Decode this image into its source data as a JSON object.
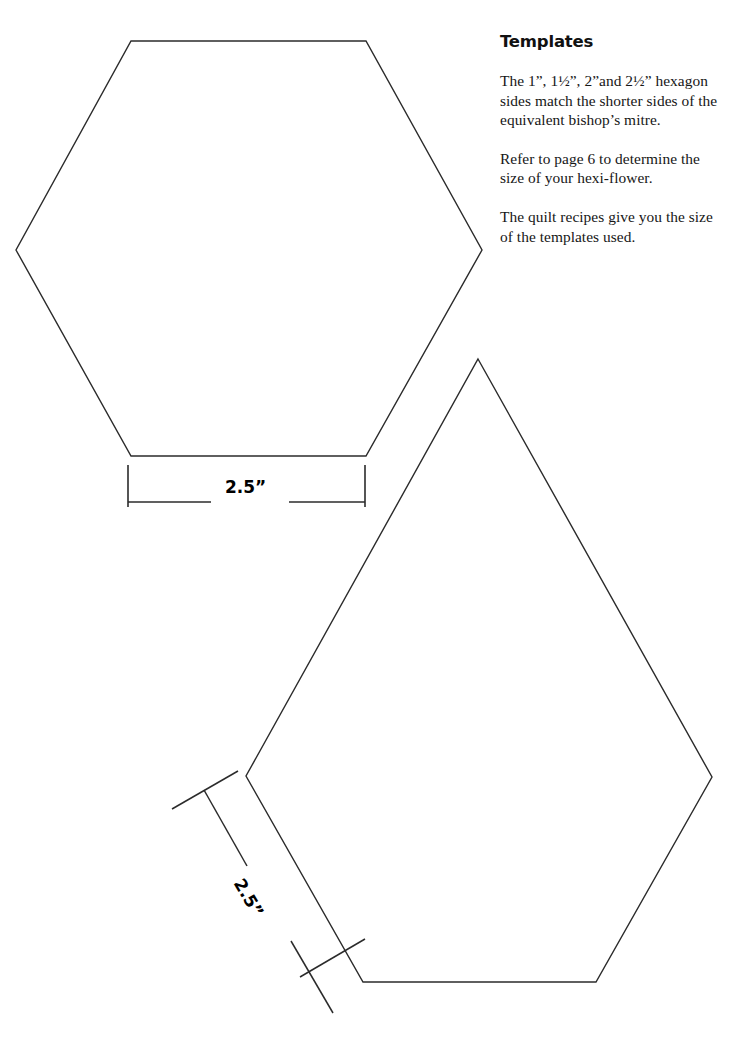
{
  "page": {
    "width": 749,
    "height": 1050,
    "background_color": "#ffffff",
    "ink_color": "#2b2b2b"
  },
  "sidebar": {
    "heading": "Templates",
    "paragraphs": [
      "The 1”, 1½”, 2”and 2½” hexagon sides match the shorter sides of the equivalent bishop’s mitre.",
      "Refer to page 6 to determine the size of your hexi-flower.",
      "The quilt recipes give you the size of the templates used."
    ]
  },
  "templates": [
    {
      "name": "hexagon-template",
      "shape": "hexagon",
      "dimension_label": "2.5”",
      "points": "131,41 366,41 482,250 366,456 131,456 16,250",
      "dimension": {
        "line": "128,503 208,503",
        "line2": "288,503 365,503",
        "tick_left": "128,465 128,507",
        "tick_right": "365,465 365,507"
      }
    },
    {
      "name": "bishops-mitre-template",
      "shape": "pentagon",
      "dimension_label": "2.5”",
      "points": "478,359 712,777 596,982 363,982 246,776",
      "dimension": {
        "line": "203,790 246,864",
        "line2": "290,940 332,1012",
        "tick_top": "171,809 237,771",
        "tick_bottom": "299,977 364,939"
      }
    }
  ]
}
